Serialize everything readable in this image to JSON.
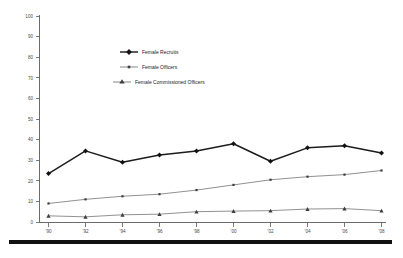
{
  "chart_data": {
    "type": "line",
    "title": "",
    "xlabel": "",
    "ylabel": "",
    "categories": [
      "'90",
      "'92",
      "'94",
      "'96",
      "'98",
      "'00",
      "'02",
      "'04",
      "'06",
      "'08"
    ],
    "x_tick_labels": [
      "'90",
      "'92",
      "'94",
      "'96",
      "'98",
      "'00",
      "'02",
      "'04",
      "'06",
      "'08"
    ],
    "y_tick_labels": [
      "0",
      "10",
      "20",
      "30",
      "40",
      "50",
      "60",
      "70",
      "80",
      "90",
      "100"
    ],
    "y_ticks": [
      0,
      10,
      20,
      30,
      40,
      50,
      60,
      70,
      80,
      90,
      100
    ],
    "ylim": [
      0,
      100
    ],
    "grid": false,
    "legend_position": "upper-center-inside",
    "series": [
      {
        "name": "Female Recruits",
        "marker": "diamond",
        "color": "#121212",
        "line_weight": "thick",
        "values": [
          23.5,
          34.5,
          29.0,
          32.5,
          34.5,
          38.0,
          29.5,
          36.0,
          37.0,
          33.5
        ]
      },
      {
        "name": "Female Officers",
        "marker": "dot",
        "color": "#555555",
        "line_weight": "thin",
        "values": [
          9.0,
          11.0,
          12.5,
          13.5,
          15.5,
          18.0,
          20.5,
          22.0,
          23.0,
          25.0
        ]
      },
      {
        "name": "Female Commissioned Officers",
        "marker": "triangle",
        "color": "#555555",
        "line_weight": "thin",
        "values": [
          3.0,
          2.5,
          3.5,
          3.8,
          5.0,
          5.3,
          5.5,
          6.3,
          6.5,
          5.5
        ]
      }
    ]
  },
  "legend": {
    "items": [
      {
        "label": "Female Recruits"
      },
      {
        "label": "Female Officers"
      },
      {
        "label": "Female Commissioned Officers"
      }
    ]
  },
  "colors": {
    "axis": "#6b6b6b",
    "recruits": "#121212",
    "officers": "#555555",
    "commissioned": "#3d3d3d",
    "footer_rule": "#111111",
    "background": "#ffffff"
  }
}
